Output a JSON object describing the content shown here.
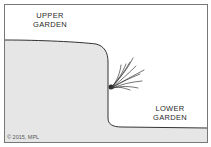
{
  "diagram": {
    "labels": {
      "upper_line1": "UPPER",
      "upper_line2": "GARDEN",
      "lower_line1": "LOWER",
      "lower_line2": "GARDEN"
    },
    "copyright": "© 2015, MPL",
    "colors": {
      "soil_fill": "#e6e6e6",
      "outline": "#333333",
      "frame": "#777777",
      "background": "#ffffff",
      "roots": "#3a3a3a"
    }
  }
}
